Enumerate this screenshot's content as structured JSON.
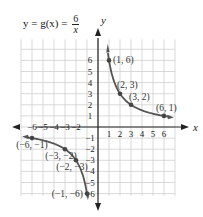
{
  "chart_data": {
    "type": "line",
    "title_parts": {
      "lhs": "y = g(x) = ",
      "numerator": "6",
      "denominator": "x"
    },
    "xlabel": "x",
    "ylabel": "y",
    "xlim": [
      -7,
      7
    ],
    "ylim": [
      -6.3,
      7.7
    ],
    "grid": true,
    "x_ticks": [
      -6,
      -5,
      -4,
      -3,
      -2,
      1,
      2,
      3,
      4,
      5,
      6
    ],
    "y_ticks": [
      -6,
      -5,
      -4,
      -3,
      -2,
      -1,
      1,
      2,
      3,
      4,
      5,
      6
    ],
    "series": [
      {
        "name": "positive branch",
        "function": "6/x",
        "x_range": [
          0.9,
          6.6
        ]
      },
      {
        "name": "negative branch",
        "function": "6/x",
        "x_range": [
          -6.6,
          -0.95
        ]
      }
    ],
    "points": [
      {
        "x": 1,
        "y": 6,
        "label": "(1, 6)"
      },
      {
        "x": 2,
        "y": 3,
        "label": "(2, 3)"
      },
      {
        "x": 3,
        "y": 2,
        "label": "(3, 2)"
      },
      {
        "x": 6,
        "y": 1,
        "label": "(6, 1)"
      },
      {
        "x": -6,
        "y": -1,
        "label": "(−6, −1)"
      },
      {
        "x": -3,
        "y": -2,
        "label": "(−3, −2)"
      },
      {
        "x": -2,
        "y": -3,
        "label": "(−2, −3)"
      },
      {
        "x": -1,
        "y": -6,
        "label": "(−1, −6)"
      }
    ],
    "colors": {
      "curve": "#555555",
      "axis": "#222222",
      "grid": "#cfcfcf",
      "point": "#444444"
    }
  }
}
